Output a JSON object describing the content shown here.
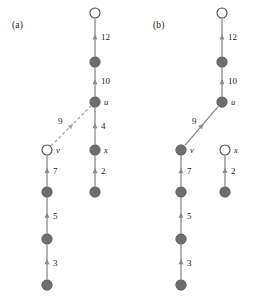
{
  "figure": {
    "background": "#ffffff",
    "node_fill_dark": "#6e6e6e",
    "node_fill_open": "#ffffff",
    "node_stroke": "#4a4a4a",
    "edge_solid_color": "#8a8a8a",
    "edge_dashed_color": "#a8a8a8",
    "label_color": "#1c1c1c"
  },
  "panels": [
    {
      "id": "a",
      "label": "(a)",
      "label_pos": {
        "x": 12,
        "y": 20
      },
      "nodes": [
        {
          "name": "a-root",
          "x": 95,
          "y": 13,
          "filled": false,
          "label": ""
        },
        {
          "name": "a-n2",
          "x": 95,
          "y": 62,
          "filled": true,
          "label": ""
        },
        {
          "name": "a-u",
          "x": 95,
          "y": 102,
          "filled": true,
          "label": "u",
          "lx": 104,
          "ly": 97
        },
        {
          "name": "a-x",
          "x": 95,
          "y": 150,
          "filled": true,
          "label": "x",
          "lx": 104,
          "ly": 145
        },
        {
          "name": "a-xchild",
          "x": 95,
          "y": 192,
          "filled": true,
          "label": ""
        },
        {
          "name": "a-v",
          "x": 47,
          "y": 150,
          "filled": false,
          "label": "v",
          "lx": 56,
          "ly": 145
        },
        {
          "name": "a-v1",
          "x": 47,
          "y": 192,
          "filled": true,
          "label": ""
        },
        {
          "name": "a-v2",
          "x": 47,
          "y": 239,
          "filled": true,
          "label": ""
        },
        {
          "name": "a-v3",
          "x": 47,
          "y": 285,
          "filled": true,
          "label": ""
        }
      ],
      "edges": [
        {
          "name": "a-edge-12",
          "from": "a-n2",
          "to": "a-root",
          "weight": "12",
          "style": "solid",
          "lx": 101,
          "ly": 32
        },
        {
          "name": "a-edge-10",
          "from": "a-u",
          "to": "a-n2",
          "weight": "10",
          "style": "solid",
          "lx": 101,
          "ly": 76
        },
        {
          "name": "a-edge-4",
          "from": "a-x",
          "to": "a-u",
          "weight": "4",
          "style": "solid",
          "lx": 101,
          "ly": 121
        },
        {
          "name": "a-edge-2",
          "from": "a-xchild",
          "to": "a-x",
          "weight": "2",
          "style": "solid",
          "lx": 101,
          "ly": 166
        },
        {
          "name": "a-edge-9",
          "from": "a-v",
          "to": "a-u",
          "weight": "9",
          "style": "dashed",
          "lx": 58,
          "ly": 116
        },
        {
          "name": "a-edge-7",
          "from": "a-v1",
          "to": "a-v",
          "weight": "7",
          "style": "solid",
          "lx": 53,
          "ly": 166
        },
        {
          "name": "a-edge-5",
          "from": "a-v2",
          "to": "a-v1",
          "weight": "5",
          "style": "solid",
          "lx": 53,
          "ly": 211
        },
        {
          "name": "a-edge-3",
          "from": "a-v3",
          "to": "a-v2",
          "weight": "3",
          "style": "solid",
          "lx": 53,
          "ly": 258
        }
      ]
    },
    {
      "id": "b",
      "label": "(b)",
      "label_pos": {
        "x": 153,
        "y": 20
      },
      "nodes": [
        {
          "name": "b-root",
          "x": 222,
          "y": 13,
          "filled": false,
          "label": ""
        },
        {
          "name": "b-n2",
          "x": 222,
          "y": 62,
          "filled": true,
          "label": ""
        },
        {
          "name": "b-u",
          "x": 222,
          "y": 102,
          "filled": true,
          "label": "u",
          "lx": 231,
          "ly": 97
        },
        {
          "name": "b-x",
          "x": 225,
          "y": 150,
          "filled": false,
          "label": "x",
          "lx": 234,
          "ly": 145
        },
        {
          "name": "b-xchild",
          "x": 225,
          "y": 192,
          "filled": true,
          "label": ""
        },
        {
          "name": "b-v",
          "x": 181,
          "y": 150,
          "filled": true,
          "label": "v",
          "lx": 190,
          "ly": 145
        },
        {
          "name": "b-v1",
          "x": 181,
          "y": 192,
          "filled": true,
          "label": ""
        },
        {
          "name": "b-v2",
          "x": 181,
          "y": 239,
          "filled": true,
          "label": ""
        },
        {
          "name": "b-v3",
          "x": 181,
          "y": 285,
          "filled": true,
          "label": ""
        }
      ],
      "edges": [
        {
          "name": "b-edge-12",
          "from": "b-n2",
          "to": "b-root",
          "weight": "12",
          "style": "solid",
          "lx": 228,
          "ly": 32
        },
        {
          "name": "b-edge-10",
          "from": "b-u",
          "to": "b-n2",
          "weight": "10",
          "style": "solid",
          "lx": 228,
          "ly": 76
        },
        {
          "name": "b-edge-2",
          "from": "b-xchild",
          "to": "b-x",
          "weight": "2",
          "style": "solid",
          "lx": 231,
          "ly": 166
        },
        {
          "name": "b-edge-9",
          "from": "b-v",
          "to": "b-u",
          "weight": "9",
          "style": "solid",
          "lx": 192,
          "ly": 116
        },
        {
          "name": "b-edge-7",
          "from": "b-v1",
          "to": "b-v",
          "weight": "7",
          "style": "solid",
          "lx": 187,
          "ly": 166
        },
        {
          "name": "b-edge-5",
          "from": "b-v2",
          "to": "b-v1",
          "weight": "5",
          "style": "solid",
          "lx": 187,
          "ly": 211
        },
        {
          "name": "b-edge-3",
          "from": "b-v3",
          "to": "b-v2",
          "weight": "3",
          "style": "solid",
          "lx": 187,
          "ly": 258
        }
      ]
    }
  ]
}
